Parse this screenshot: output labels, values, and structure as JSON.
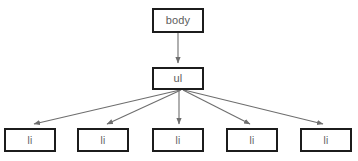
{
  "diagram": {
    "type": "dom-tree",
    "background_color": "#ffffff",
    "node_border_color": "#1c1c1c",
    "node_fill_color": "#ffffff",
    "label_color": "#5c5c5c",
    "edge_color": "#6e6e6e",
    "nodes": [
      {
        "id": "body",
        "label": "body",
        "x": 152,
        "y": 8,
        "w": 52,
        "h": 25
      },
      {
        "id": "ul",
        "label": "ul",
        "x": 152,
        "y": 67,
        "w": 52,
        "h": 23
      },
      {
        "id": "li1",
        "label": "li",
        "x": 4,
        "y": 128,
        "w": 52,
        "h": 24
      },
      {
        "id": "li2",
        "label": "li",
        "x": 77,
        "y": 128,
        "w": 52,
        "h": 24
      },
      {
        "id": "li3",
        "label": "li",
        "x": 152,
        "y": 128,
        "w": 52,
        "h": 24
      },
      {
        "id": "li4",
        "label": "li",
        "x": 226,
        "y": 128,
        "w": 52,
        "h": 24
      },
      {
        "id": "li5",
        "label": "li",
        "x": 300,
        "y": 128,
        "w": 52,
        "h": 24
      }
    ],
    "edges": [
      {
        "from": "body",
        "to": "li-root",
        "x1": 178,
        "y1": 33,
        "x2": 178,
        "y2": 66
      },
      {
        "from": "ul",
        "to": "li1",
        "x1": 180,
        "y1": 90,
        "x2": 31,
        "y2": 126
      },
      {
        "from": "ul",
        "to": "li2",
        "x1": 181,
        "y1": 90,
        "x2": 104,
        "y2": 126
      },
      {
        "from": "ul",
        "to": "li3",
        "x1": 179,
        "y1": 90,
        "x2": 179,
        "y2": 126
      },
      {
        "from": "ul",
        "to": "li4",
        "x1": 183,
        "y1": 90,
        "x2": 253,
        "y2": 126
      },
      {
        "from": "ul",
        "to": "li5",
        "x1": 184,
        "y1": 90,
        "x2": 326,
        "y2": 126
      }
    ]
  }
}
